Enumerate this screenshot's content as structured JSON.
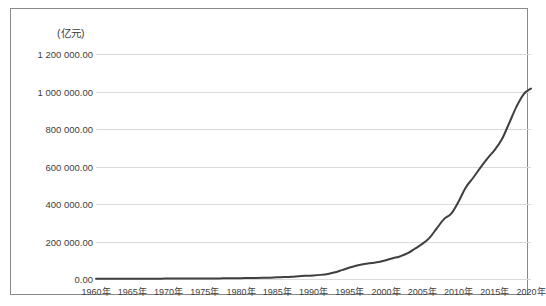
{
  "chart_data": {
    "type": "line",
    "title": "",
    "subtitle": "",
    "unit_label": "(亿元)",
    "xlabel": "",
    "ylabel": "",
    "xlim": [
      1960,
      2020
    ],
    "ylim": [
      0,
      1200000
    ],
    "grid": true,
    "legend": null,
    "line_color": "#3f3f3f",
    "grid_color": "#d9d9d9",
    "frame_color": "#8a8a8a",
    "y_ticks": [
      0,
      200000,
      400000,
      600000,
      800000,
      1000000,
      1200000
    ],
    "y_tick_labels": [
      "0.00",
      "200 000.00",
      "400 000.00",
      "600 000.00",
      "800 000.00",
      "1 000 000.00",
      "1 200 000.00"
    ],
    "x_ticks": [
      1960,
      1965,
      1970,
      1975,
      1980,
      1985,
      1990,
      1995,
      2000,
      2005,
      2010,
      2015,
      2020
    ],
    "x_tick_labels": [
      "1960年",
      "1965年",
      "1970年",
      "1975年",
      "1980年",
      "1985年",
      "1990年",
      "1995年",
      "2000年",
      "2005年",
      "2010年",
      "2015年",
      "2020年"
    ],
    "series": [
      {
        "name": "国内生产总值",
        "x": [
          1960,
          1961,
          1962,
          1963,
          1964,
          1965,
          1966,
          1967,
          1968,
          1969,
          1970,
          1971,
          1972,
          1973,
          1974,
          1975,
          1976,
          1977,
          1978,
          1979,
          1980,
          1981,
          1982,
          1983,
          1984,
          1985,
          1986,
          1987,
          1988,
          1989,
          1990,
          1991,
          1992,
          1993,
          1994,
          1995,
          1996,
          1997,
          1998,
          1999,
          2000,
          2001,
          2002,
          2003,
          2004,
          2005,
          2006,
          2007,
          2008,
          2009,
          2010,
          2011,
          2012,
          2013,
          2014,
          2015,
          2016,
          2017,
          2018,
          2019,
          2020
        ],
        "values": [
          1470,
          1220,
          1150,
          1250,
          1455,
          1720,
          1870,
          1780,
          1720,
          1940,
          2270,
          2430,
          2520,
          2720,
          2790,
          3010,
          2940,
          3210,
          3679,
          4101,
          4588,
          4936,
          5373,
          6021,
          7279,
          9099,
          10377,
          12175,
          15181,
          17180,
          18873,
          22006,
          27195,
          35674,
          48638,
          61340,
          71814,
          79715,
          85196,
          90564,
          100280,
          110863,
          121717,
          137422,
          161840,
          187319,
          219439,
          270092,
          319245,
          348518,
          412119,
          487940,
          538580,
          592963,
          643563,
          688858,
          746395,
          832036,
          919281,
          986515,
          1015986
        ],
        "color": "#3f3f3f",
        "width": 2
      }
    ],
    "annotations": []
  }
}
